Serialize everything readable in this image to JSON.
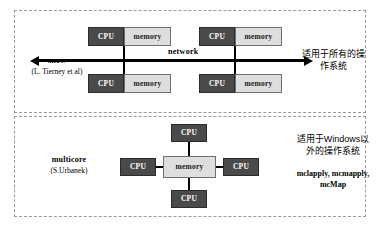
{
  "panels": {
    "snow": {
      "package_name": "snow",
      "package_author": "(L. Tierney et al)",
      "bus_label": "network",
      "os_note": "适用于所有的操作系统",
      "nodes": [
        {
          "cpu": "CPU",
          "memory": "memory"
        },
        {
          "cpu": "CPU",
          "memory": "memory"
        },
        {
          "cpu": "CPU",
          "memory": "memory"
        },
        {
          "cpu": "CPU",
          "memory": "memory"
        }
      ]
    },
    "multicore": {
      "package_name": "multicore",
      "package_author": "(S.Urbanek)",
      "memory_label": "memory",
      "os_note": "适用于Windows以外的操作系统",
      "functions": "mclapply, mcmapply, mcMap",
      "cpus": [
        {
          "label": "CPU"
        },
        {
          "label": "CPU"
        },
        {
          "label": "CPU"
        },
        {
          "label": "CPU"
        }
      ]
    }
  },
  "colors": {
    "cpu_fill": "#4a4a4a",
    "cpu_text": "#ffffff",
    "memory_fill": "#dedede",
    "memory_text": "#1a1a1a",
    "connector": "#000000",
    "panel_border": "#9a9a9a",
    "background": "#ffffff"
  }
}
